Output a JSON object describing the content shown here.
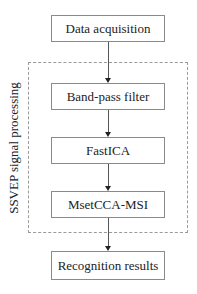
{
  "diagram": {
    "type": "flowchart",
    "steps": [
      {
        "label": "Data acquisition"
      },
      {
        "label": "Band-pass filter"
      },
      {
        "label": "FastICA"
      },
      {
        "label": "MsetCCA-MSI"
      },
      {
        "label": "Recognition results"
      }
    ],
    "group": {
      "label": "SSVEP signal processing",
      "contains": [
        "Band-pass filter",
        "FastICA",
        "MsetCCA-MSI"
      ]
    },
    "edges": [
      [
        "Data acquisition",
        "Band-pass filter"
      ],
      [
        "Band-pass filter",
        "FastICA"
      ],
      [
        "FastICA",
        "MsetCCA-MSI"
      ],
      [
        "MsetCCA-MSI",
        "Recognition results"
      ]
    ],
    "colors": {
      "box_border": "#8a8a8a",
      "group_border": "#9a9a9a",
      "text": "#222222"
    }
  }
}
